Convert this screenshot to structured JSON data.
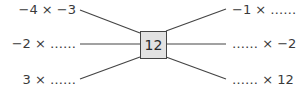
{
  "diagram": {
    "center": "12",
    "left_items": [
      {
        "text": "−4 × −3"
      },
      {
        "text": "−2 × ……"
      },
      {
        "text": "3 × ……"
      }
    ],
    "right_items": [
      {
        "text": "−1 × ……"
      },
      {
        "text": "…… × −2"
      },
      {
        "text": "…… × 12"
      }
    ]
  },
  "colors": {
    "box_fill": "#e2e2e2",
    "line": "#444444",
    "text": "#3a3a3a"
  }
}
